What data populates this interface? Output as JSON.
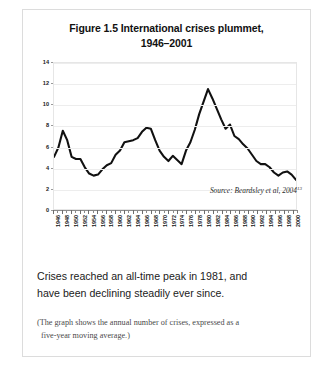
{
  "figure": {
    "title_line1": "Figure 1.5 International crises plummet,",
    "title_line2": "1946–2001",
    "source_text": "Source: Beardsley et al, 2004",
    "source_superscript": "13",
    "caption_line1": "Crises reached an all-time peak in 1981, and",
    "caption_line2": "have been declining steadily ever since.",
    "note_line1": "(The graph shows the annual number of crises, expressed as a",
    "note_line2": "five-year moving average.)"
  },
  "chart_data": {
    "type": "line",
    "title": "Figure 1.5 International crises plummet, 1946–2001",
    "xlabel": "",
    "ylabel": "",
    "xlim": [
      1946,
      2001
    ],
    "ylim": [
      0,
      14
    ],
    "ytick_values": [
      0,
      2,
      4,
      6,
      8,
      10,
      12,
      14
    ],
    "xtick_labels": [
      "1946",
      "1948",
      "1950",
      "1952",
      "1954",
      "1956",
      "1958",
      "1960",
      "1962",
      "1964",
      "1966",
      "1968",
      "1970",
      "1972",
      "1974",
      "1976",
      "1978",
      "1980",
      "1982",
      "1984",
      "1986",
      "1988",
      "1990",
      "1992",
      "1994",
      "1996",
      "1998",
      "2000"
    ],
    "grid": true,
    "legend": null,
    "line_color": "#111111",
    "series": [
      {
        "name": "Annual number of international crises (five-year moving average)",
        "x": [
          1946,
          1947,
          1948,
          1949,
          1950,
          1951,
          1952,
          1953,
          1954,
          1955,
          1956,
          1957,
          1958,
          1959,
          1960,
          1961,
          1962,
          1963,
          1964,
          1965,
          1966,
          1967,
          1968,
          1969,
          1970,
          1971,
          1972,
          1973,
          1974,
          1975,
          1976,
          1977,
          1978,
          1979,
          1980,
          1981,
          1982,
          1983,
          1984,
          1985,
          1986,
          1987,
          1988,
          1989,
          1990,
          1991,
          1992,
          1993,
          1994,
          1995,
          1996,
          1997,
          1998,
          1999,
          2000,
          2001
        ],
        "values": [
          5.0,
          5.9,
          7.5,
          6.6,
          5.0,
          4.8,
          4.8,
          4.0,
          3.4,
          3.2,
          3.3,
          3.8,
          4.2,
          4.4,
          5.2,
          5.6,
          6.4,
          6.5,
          6.6,
          6.8,
          7.4,
          7.8,
          7.7,
          6.6,
          5.6,
          5.0,
          4.6,
          5.1,
          4.7,
          4.3,
          5.6,
          6.4,
          7.6,
          9.1,
          10.3,
          11.5,
          10.6,
          9.6,
          8.6,
          7.7,
          8.1,
          7.0,
          6.7,
          6.2,
          5.8,
          5.2,
          4.6,
          4.3,
          4.3,
          4.0,
          3.5,
          3.2,
          3.5,
          3.6,
          3.3,
          2.8
        ]
      }
    ]
  }
}
